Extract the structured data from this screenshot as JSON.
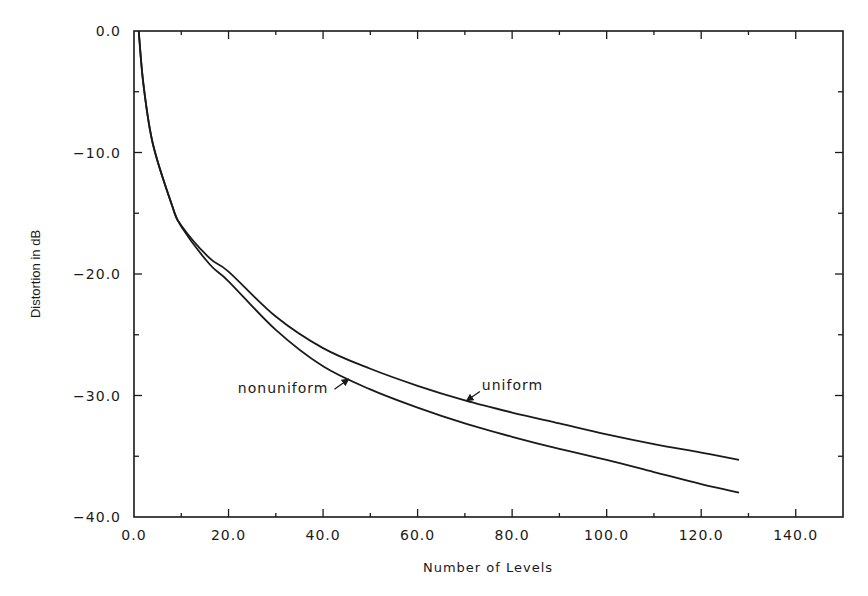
{
  "chart_data": {
    "type": "line",
    "title": "",
    "xlabel": "Number of Levels",
    "ylabel": "Distortion in dB",
    "xlim": [
      0,
      150
    ],
    "ylim": [
      -40,
      0
    ],
    "xticks": [
      0,
      20,
      40,
      60,
      80,
      100,
      120,
      140
    ],
    "xtick_labels": [
      "0.0",
      "20.0",
      "40.0",
      "60.0",
      "80.0",
      "100.0",
      "120.0",
      "140.0"
    ],
    "yticks": [
      0,
      -10,
      -20,
      -30,
      -40
    ],
    "ytick_labels": [
      "0.0",
      "-10.0",
      "-20.0",
      "-30.0",
      "-40.0"
    ],
    "grid": false,
    "legend": "inline annotations with arrows",
    "x": [
      1,
      2,
      4,
      8,
      10,
      16,
      20,
      30,
      40,
      50,
      60,
      70,
      80,
      90,
      100,
      110,
      120,
      128
    ],
    "series": [
      {
        "name": "uniform",
        "values": [
          0,
          -4.4,
          -9.3,
          -14.3,
          -16.0,
          -18.7,
          -19.8,
          -23.5,
          -26.1,
          -27.8,
          -29.2,
          -30.4,
          -31.4,
          -32.3,
          -33.2,
          -34.0,
          -34.7,
          -35.3
        ]
      },
      {
        "name": "nonuniform",
        "values": [
          0,
          -4.4,
          -9.3,
          -14.3,
          -16.1,
          -19.2,
          -20.6,
          -24.6,
          -27.6,
          -29.5,
          -31.0,
          -32.3,
          -33.4,
          -34.4,
          -35.3,
          -36.3,
          -37.3,
          -38.0
        ]
      }
    ],
    "annotations": [
      {
        "text": "uniform",
        "arrow_to_x": 70,
        "arrow_to_y": -30.5
      },
      {
        "text": "nonuniform",
        "arrow_to_x": 46,
        "arrow_to_y": -28.5
      }
    ]
  }
}
